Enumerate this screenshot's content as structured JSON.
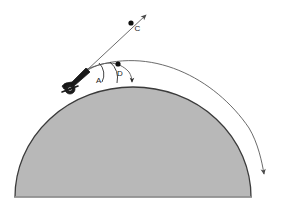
{
  "figure": {
    "width": 283,
    "height": 209,
    "background_color": "#ffffff"
  },
  "planet": {
    "name": "planet-dome",
    "fill_color": "#b8b8b8",
    "stroke_color": "#3b3b3b",
    "center_x": 133,
    "center_y": 197,
    "radius_x": 118,
    "radius_y": 110
  },
  "cannon": {
    "name": "cannon",
    "fill_color": "#1a1a1a",
    "muzzle_x": 86,
    "muzzle_y": 70,
    "base_x": 68,
    "base_y": 90,
    "wheel_x": 70,
    "wheel_y": 88,
    "wheel_radius": 5
  },
  "labels": {
    "point_c": "C",
    "point_d": "D",
    "angle_a": "A"
  },
  "points": [
    {
      "id": "C",
      "label": "C",
      "x": 131,
      "y": 23,
      "radius": 2.6
    },
    {
      "id": "D",
      "label": "D",
      "x": 118,
      "y": 64,
      "radius": 2.6
    }
  ],
  "paths": {
    "straight_ray": {
      "name": "straight-line-trajectory",
      "from_x": 86,
      "from_y": 70,
      "to_x": 148,
      "to_y": 13,
      "stroke_color": "#555555",
      "arrow": "up-right"
    },
    "inner_arc": {
      "name": "inner-curved-trajectory",
      "stroke_color": "#555555",
      "arrow": "down-right",
      "end_x": 132,
      "end_y": 85
    },
    "outer_arc": {
      "name": "outer-curved-trajectory",
      "stroke_color": "#555555",
      "arrow": "down",
      "end_x": 264,
      "end_y": 180
    }
  },
  "angle_arcs": {
    "arc_a": {
      "name": "angle-arc-a",
      "label": "A"
    },
    "arc_d": {
      "name": "angle-arc-d",
      "label": "D"
    }
  },
  "colors": {
    "line": "#555555",
    "dark": "#1a1a1a",
    "dome_fill": "#b8b8b8",
    "dome_stroke": "#3b3b3b"
  }
}
